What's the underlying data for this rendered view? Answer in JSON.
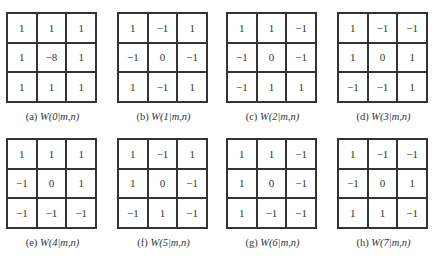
{
  "figure": {
    "panels": [
      {
        "label": "(a)",
        "title": "W(0|m,n)",
        "matrix": [
          [
            "1",
            "1",
            "1"
          ],
          [
            "1",
            "−8",
            "1"
          ],
          [
            "1",
            "1",
            "1"
          ]
        ]
      },
      {
        "label": "(b)",
        "title": "W(1|m,n)",
        "matrix": [
          [
            "1",
            "−1",
            "1"
          ],
          [
            "−1",
            "0",
            "−1"
          ],
          [
            "1",
            "−1",
            "1"
          ]
        ]
      },
      {
        "label": "(c)",
        "title": "W(2|m,n)",
        "matrix": [
          [
            "1",
            "1",
            "−1"
          ],
          [
            "−1",
            "0",
            "−1"
          ],
          [
            "−1",
            "1",
            "1"
          ]
        ]
      },
      {
        "label": "(d)",
        "title": "W(3|m,n)",
        "matrix": [
          [
            "1",
            "−1",
            "−1"
          ],
          [
            "1",
            "0",
            "1"
          ],
          [
            "−1",
            "−1",
            "1"
          ]
        ]
      },
      {
        "label": "(e)",
        "title": "W(4|m,n)",
        "matrix": [
          [
            "1",
            "1",
            "1"
          ],
          [
            "−1",
            "0",
            "1"
          ],
          [
            "−1",
            "−1",
            "−1"
          ]
        ]
      },
      {
        "label": "(f)",
        "title": "W(5|m,n)",
        "matrix": [
          [
            "1",
            "−1",
            "1"
          ],
          [
            "1",
            "0",
            "−1"
          ],
          [
            "−1",
            "1",
            "−1"
          ]
        ]
      },
      {
        "label": "(g)",
        "title": "W(6|m,n)",
        "matrix": [
          [
            "1",
            "1",
            "−1"
          ],
          [
            "1",
            "0",
            "−1"
          ],
          [
            "1",
            "−1",
            "−1"
          ]
        ]
      },
      {
        "label": "(h)",
        "title": "W(7|m,n)",
        "matrix": [
          [
            "1",
            "−1",
            "−1"
          ],
          [
            "−1",
            "0",
            "1"
          ],
          [
            "1",
            "1",
            "−1"
          ]
        ]
      }
    ]
  },
  "layout": {
    "positions": [
      [
        6,
        12
      ],
      [
        117,
        12
      ],
      [
        226,
        12
      ],
      [
        337,
        12
      ],
      [
        6,
        138
      ],
      [
        117,
        138
      ],
      [
        226,
        138
      ],
      [
        337,
        138
      ]
    ]
  }
}
